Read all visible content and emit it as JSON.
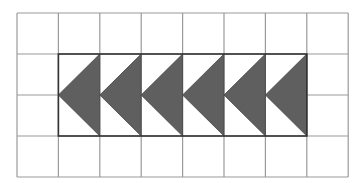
{
  "figure": {
    "grid": {
      "columns": 8,
      "rows": 4,
      "left": 17,
      "top": 13,
      "cell_w": 41.4,
      "cell_h": 41,
      "line_color": "#9a9a9a"
    },
    "inner_rect": {
      "col_start": 1,
      "col_end": 7,
      "row_start": 1,
      "row_end": 3,
      "border_color": "#333333"
    },
    "triangles": {
      "count": 6,
      "direction": "left",
      "fill": "#5f5f5f",
      "stroke": "#444444"
    }
  }
}
